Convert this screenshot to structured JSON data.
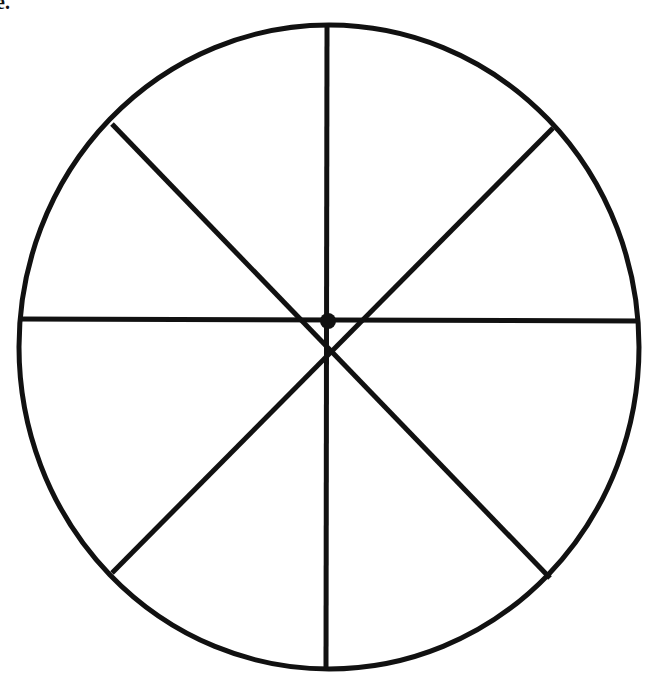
{
  "figure": {
    "corner_label": "e.",
    "stroke_color": "#111111",
    "background": "#ffffff",
    "circle": {
      "cx": 329,
      "cy": 348,
      "r": 310,
      "stroke_width": 5
    },
    "center_dot": {
      "r": 8
    },
    "sectors": 8,
    "lines": [
      {
        "name": "vertical",
        "x1": 327,
        "y1": 26,
        "x2": 326,
        "y2": 668
      },
      {
        "name": "horizontal",
        "x1": 20,
        "y1": 319,
        "x2": 640,
        "y2": 320
      },
      {
        "name": "diagonal-nw-se",
        "x1": 112,
        "y1": 124,
        "x2": 550,
        "y2": 578
      },
      {
        "name": "diagonal-ne-sw",
        "x1": 553,
        "y1": 128,
        "x2": 112,
        "y2": 573
      }
    ]
  }
}
